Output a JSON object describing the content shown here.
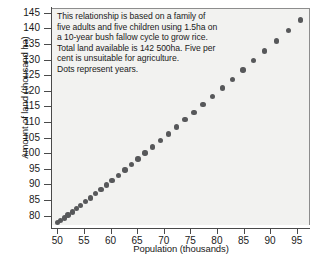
{
  "chart_data": {
    "type": "scatter",
    "title": "",
    "xlabel": "Population (thousands)",
    "ylabel": "Amount of land (thousand ha)",
    "xlim": [
      49.0,
      97.5
    ],
    "ylim": [
      77.0,
      146.5
    ],
    "xticks": [
      50,
      55,
      60,
      65,
      70,
      75,
      80,
      85,
      90,
      95
    ],
    "yticks": [
      80,
      85,
      90,
      95,
      100,
      105,
      110,
      115,
      120,
      125,
      130,
      135,
      140,
      145
    ],
    "grid": false,
    "legend": null,
    "annotation_lines": [
      "This relationship is based on a family of",
      "five adults and five children using 1.5ha on",
      "a 10-year bush fallow cycle to grow rice.",
      "Total land available is 142 500ha. Five per",
      "cent is unsuitable for agriculture.",
      "Dots represent years."
    ],
    "marker_color": "#57585a",
    "plot_background": "#f2f2f0",
    "axis_color": "#4a4a4a",
    "point_note": "Each dot represents one year; population grows exponentially and required land rises with it.",
    "x": [
      50.0,
      50.6,
      51.3,
      52.0,
      52.8,
      53.6,
      54.4,
      55.3,
      56.2,
      57.2,
      58.2,
      59.2,
      60.3,
      61.5,
      62.7,
      63.9,
      65.2,
      66.5,
      67.9,
      69.4,
      70.9,
      72.4,
      74.0,
      75.7,
      77.4,
      79.2,
      81.0,
      82.9,
      84.9,
      86.9,
      89.0,
      91.2,
      93.4,
      95.7
    ],
    "y": [
      77.8,
      78.5,
      79.3,
      80.2,
      81.2,
      82.2,
      83.3,
      84.5,
      85.7,
      87.0,
      88.4,
      89.8,
      91.3,
      92.9,
      94.6,
      96.3,
      98.1,
      100.0,
      102.0,
      104.1,
      106.2,
      108.4,
      110.7,
      113.1,
      115.6,
      118.2,
      120.9,
      123.7,
      126.6,
      129.6,
      132.7,
      135.9,
      139.2,
      142.6
    ]
  }
}
